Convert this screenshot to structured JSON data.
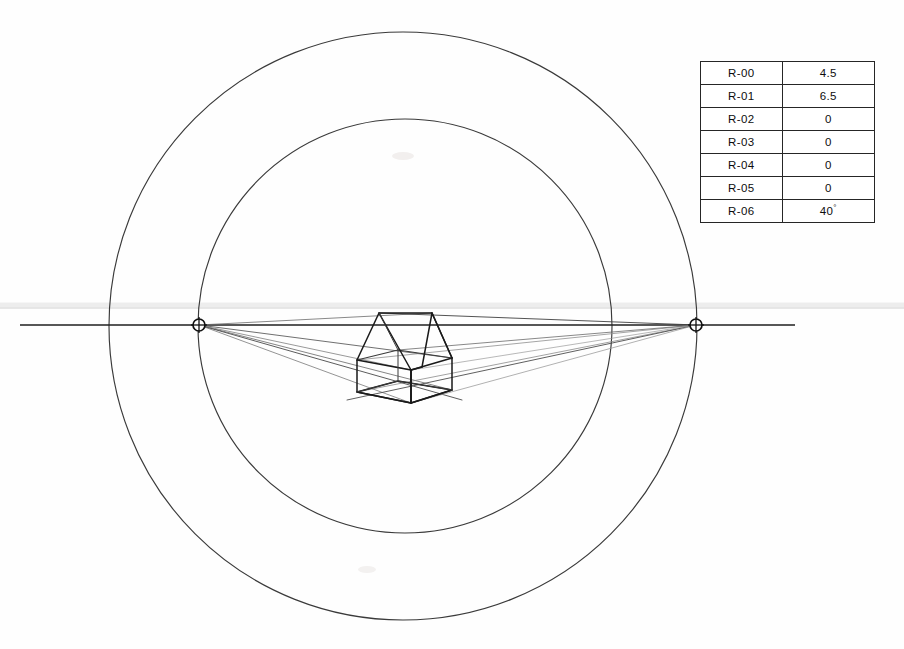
{
  "drawing": {
    "title": "two-point-perspective-construction",
    "colors": {
      "ink": "#2b2b2b",
      "ink_dark": "#1a1a1a",
      "ray_light": "#8c8c8c",
      "ray_mid": "#555555",
      "paper": "#fefefe",
      "table_border": "#262626",
      "faint_band": "#e9e9e9"
    },
    "circles": [
      {
        "name": "outer-circle",
        "cx": 403,
        "cy": 326,
        "r": 294
      },
      {
        "name": "inner-circle",
        "cx": 405,
        "cy": 326,
        "r": 207
      }
    ],
    "horizon": {
      "name": "horizon-line",
      "x1": 20,
      "y1": 325,
      "x2": 795,
      "y2": 325
    },
    "faint_band": {
      "x1": 0,
      "y1": 306,
      "x2": 904,
      "y2": 306
    },
    "vanishing_points": [
      {
        "name": "left-vanishing-point",
        "label": "VPL",
        "x": 199,
        "y": 325,
        "r": 6
      },
      {
        "name": "right-vanishing-point",
        "label": "VPR",
        "x": 696,
        "y": 325,
        "r": 6
      }
    ],
    "house": {
      "name": "house-wireframe",
      "front_left_top": [
        357,
        360
      ],
      "front_left_bottom": [
        357,
        392
      ],
      "near_corner_top": [
        411,
        370
      ],
      "near_corner_bottom": [
        411,
        403
      ],
      "right_top": [
        452,
        358
      ],
      "right_bottom": [
        452,
        390
      ],
      "back_top": [
        398,
        350
      ],
      "gable_left_apex": [
        379,
        313
      ],
      "gable_right_apex": [
        432,
        313
      ]
    }
  },
  "table": {
    "name": "parameter-table",
    "rows": [
      {
        "key": "R-00",
        "value": "4.5",
        "unit": ""
      },
      {
        "key": "R-01",
        "value": "6.5",
        "unit": ""
      },
      {
        "key": "R-02",
        "value": "0",
        "unit": ""
      },
      {
        "key": "R-03",
        "value": "0",
        "unit": ""
      },
      {
        "key": "R-04",
        "value": "0",
        "unit": ""
      },
      {
        "key": "R-05",
        "value": "0",
        "unit": ""
      },
      {
        "key": "R-06",
        "value": "40",
        "unit": "°"
      }
    ]
  }
}
